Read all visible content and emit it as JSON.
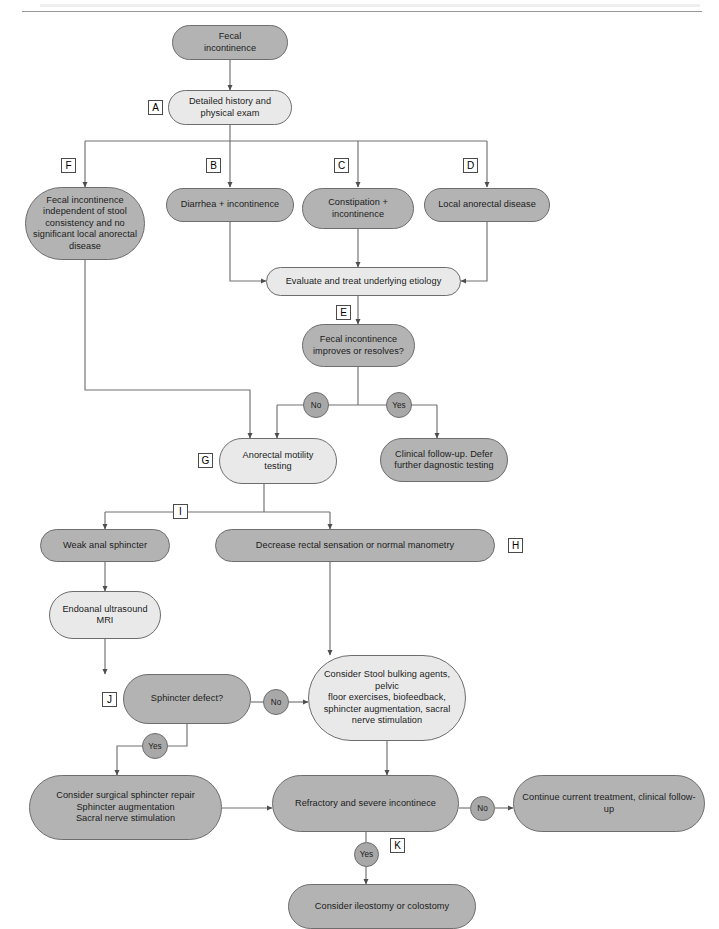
{
  "diagram": {
    "colors": {
      "node_dark": "#b3b3b3",
      "node_light": "#e9e9e9",
      "badge": "#a8a8a8",
      "stroke": "#6d6d6d",
      "wire": "#707070"
    },
    "nodes": {
      "fecal_incontinence": "Fecal\nincontinence",
      "detailed_history": "Detailed history and\nphysical exam",
      "fecal_independent": "Fecal incontinence\nindependent of stool\nconsistency and no\nsignificant local anorectal\ndisease",
      "diarrhea": "Diarrhea + incontinence",
      "constipation": "Constipation +\nincontinence",
      "local_anorectal": "Local anorectal disease",
      "evaluate_treat": "Evaluate and treat underlying etiology",
      "improves": "Fecal incontinence\nimproves or resolves?",
      "clinical_followup": "Clinical follow-up. Defer\nfurther dagnostic testing",
      "anorectal_motility": "Anorectal motility\ntesting",
      "weak_sphincter": "Weak anal sphincter",
      "decrease_rectal": "Decrease rectal sensation or normal manometry",
      "endoanal": "Endoanal ultrasound\nMRI",
      "sphincter_defect": "Sphincter defect?",
      "consider_stool": "Consider Stool bulking agents, pelvic\nfloor exercises, biofeedback,\nsphincter augmentation, sacral\nnerve stimulation",
      "surgical_repair": "Consider surgical sphincter repair\nSphincter augmentation\nSacral nerve stimulation",
      "refractory": "Refractory and severe incontinece",
      "continue_treatment": "Continue current treatment, clinical follow-up",
      "ileostomy": "Consider ileostomy or colostomy"
    },
    "tags": {
      "a": "A",
      "b": "B",
      "c": "C",
      "d": "D",
      "e": "E",
      "f": "F",
      "g": "G",
      "h": "H",
      "i": "I",
      "j": "J",
      "k": "K"
    },
    "badges": {
      "no_e": "No",
      "yes_e": "Yes",
      "no_j": "No",
      "yes_j": "Yes",
      "no_k": "No",
      "yes_k": "Yes"
    }
  }
}
